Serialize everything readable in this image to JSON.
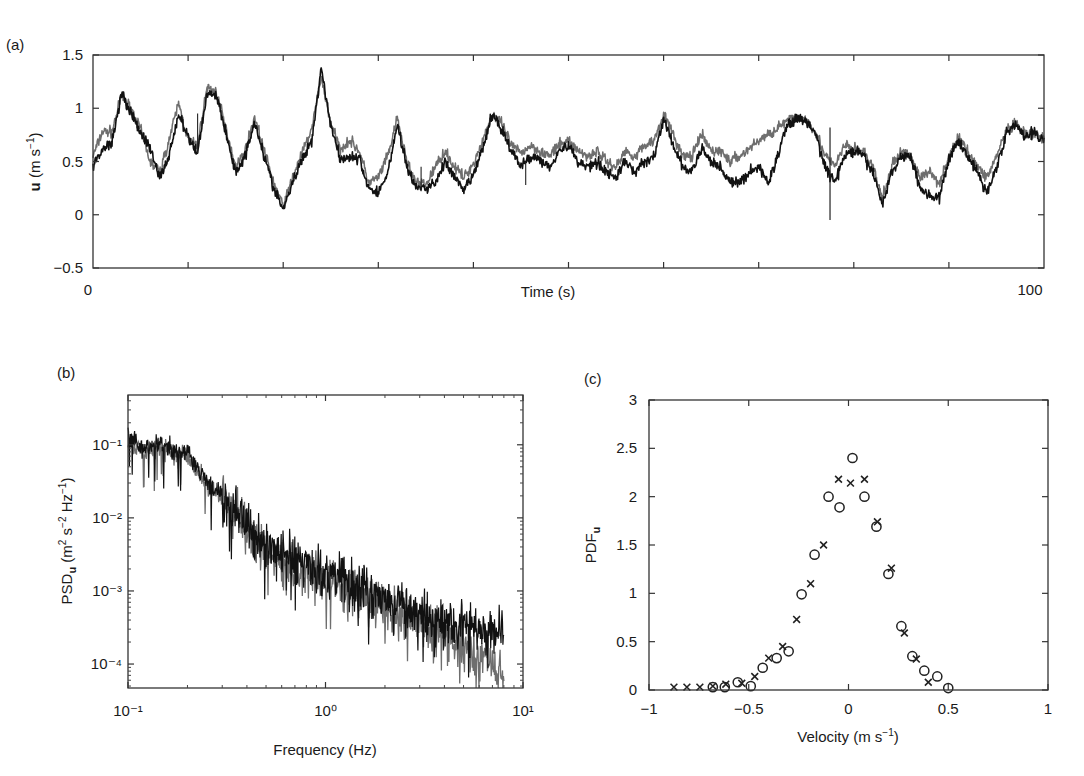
{
  "chart_data": [
    {
      "panel": "(a)",
      "type": "line",
      "title": "",
      "xlabel": "Time (s)",
      "ylabel": "u (m s⁻¹)",
      "xlim": [
        0,
        100
      ],
      "ylim": [
        -0.5,
        1.5
      ],
      "xtick_labels": [
        "0",
        "100"
      ],
      "ytick_labels": [
        "1.5",
        "1",
        "0.5",
        "0",
        "−0.5"
      ],
      "ytick_values": [
        1.5,
        1,
        0.5,
        0,
        -0.5
      ],
      "minor_xticks_every": 10,
      "grid": false,
      "legend": null,
      "series": [
        {
          "name": "measured (black)",
          "color": "#111111",
          "x": [
            0,
            1,
            2,
            3,
            4,
            5,
            6,
            7,
            8,
            9,
            10,
            11,
            12,
            13,
            14,
            15,
            16,
            17,
            18,
            19,
            20,
            21,
            22,
            23,
            24,
            25,
            26,
            27,
            28,
            29,
            30,
            31,
            32,
            33,
            34,
            35,
            36,
            37,
            38,
            39,
            40,
            41,
            42,
            43,
            44,
            45,
            46,
            47,
            48,
            49,
            50,
            51,
            52,
            53,
            54,
            55,
            56,
            57,
            58,
            59,
            60,
            61,
            62,
            63,
            64,
            65,
            66,
            67,
            68,
            69,
            70,
            71,
            72,
            73,
            74,
            75,
            76,
            77,
            78,
            79,
            80,
            81,
            82,
            83,
            84,
            85,
            86,
            87,
            88,
            89,
            90,
            91,
            92,
            93,
            94,
            95,
            96,
            97,
            98,
            99,
            100
          ],
          "values": [
            0.45,
            0.62,
            0.68,
            1.15,
            0.95,
            0.78,
            0.62,
            0.35,
            0.55,
            0.95,
            0.72,
            0.58,
            1.15,
            1.12,
            0.75,
            0.4,
            0.55,
            0.88,
            0.55,
            0.25,
            0.05,
            0.3,
            0.52,
            0.7,
            1.38,
            0.85,
            0.52,
            0.55,
            0.52,
            0.25,
            0.2,
            0.4,
            0.85,
            0.45,
            0.25,
            0.25,
            0.3,
            0.5,
            0.35,
            0.22,
            0.38,
            0.62,
            0.95,
            0.8,
            0.6,
            0.45,
            0.55,
            0.52,
            0.45,
            0.6,
            0.65,
            0.5,
            0.45,
            0.5,
            0.4,
            0.35,
            0.5,
            0.4,
            0.5,
            0.55,
            0.9,
            0.65,
            0.45,
            0.4,
            0.62,
            0.5,
            0.45,
            0.3,
            0.3,
            0.4,
            0.45,
            0.3,
            0.55,
            0.85,
            0.9,
            0.88,
            0.75,
            0.45,
            0.3,
            0.55,
            0.6,
            0.55,
            0.4,
            0.1,
            0.4,
            0.55,
            0.55,
            0.25,
            0.18,
            0.15,
            0.52,
            0.7,
            0.55,
            0.4,
            0.2,
            0.45,
            0.75,
            0.85,
            0.72,
            0.78,
            0.7
          ]
        },
        {
          "name": "simulated (grey)",
          "color": "#6e6e6e",
          "x": [
            0,
            1,
            2,
            3,
            4,
            5,
            6,
            7,
            8,
            9,
            10,
            11,
            12,
            13,
            14,
            15,
            16,
            17,
            18,
            19,
            20,
            21,
            22,
            23,
            24,
            25,
            26,
            27,
            28,
            29,
            30,
            31,
            32,
            33,
            34,
            35,
            36,
            37,
            38,
            39,
            40,
            41,
            42,
            43,
            44,
            45,
            46,
            47,
            48,
            49,
            50,
            51,
            52,
            53,
            54,
            55,
            56,
            57,
            58,
            59,
            60,
            61,
            62,
            63,
            64,
            65,
            66,
            67,
            68,
            69,
            70,
            71,
            72,
            73,
            74,
            75,
            76,
            77,
            78,
            79,
            80,
            81,
            82,
            83,
            84,
            85,
            86,
            87,
            88,
            89,
            90,
            91,
            92,
            93,
            94,
            95,
            96,
            97,
            98,
            99,
            100
          ],
          "values": [
            0.55,
            0.78,
            0.78,
            1.12,
            1.0,
            0.8,
            0.5,
            0.4,
            0.7,
            1.05,
            0.7,
            0.65,
            1.2,
            1.15,
            0.8,
            0.45,
            0.6,
            0.92,
            0.6,
            0.3,
            0.08,
            0.35,
            0.58,
            0.8,
            1.3,
            0.85,
            0.62,
            0.7,
            0.6,
            0.3,
            0.35,
            0.55,
            0.9,
            0.5,
            0.3,
            0.28,
            0.45,
            0.6,
            0.45,
            0.35,
            0.48,
            0.7,
            0.95,
            0.85,
            0.65,
            0.58,
            0.65,
            0.6,
            0.55,
            0.65,
            0.7,
            0.6,
            0.55,
            0.6,
            0.5,
            0.45,
            0.6,
            0.55,
            0.65,
            0.7,
            0.95,
            0.75,
            0.55,
            0.55,
            0.75,
            0.6,
            0.6,
            0.5,
            0.55,
            0.62,
            0.7,
            0.75,
            0.82,
            0.88,
            0.92,
            0.9,
            0.78,
            0.55,
            0.45,
            0.65,
            0.62,
            0.6,
            0.45,
            0.15,
            0.45,
            0.6,
            0.55,
            0.35,
            0.4,
            0.3,
            0.55,
            0.72,
            0.6,
            0.45,
            0.35,
            0.55,
            0.78,
            0.85,
            0.75,
            0.75,
            0.72
          ]
        }
      ],
      "annotations": [
        {
          "x": 77.5,
          "y_from": 0.82,
          "y_to": -0.05,
          "note": "single-sample spike"
        }
      ]
    },
    {
      "panel": "(b)",
      "type": "line",
      "xscale": "log",
      "yscale": "log",
      "title": "",
      "xlabel": "Frequency (Hz)",
      "ylabel": "PSD_u (m² s⁻² Hz⁻¹)",
      "xlim": [
        0.1,
        10
      ],
      "ylim": [
        4.7e-05,
        0.48
      ],
      "xtick_labels": [
        "10⁻¹",
        "10⁰",
        "10¹"
      ],
      "xtick_values": [
        0.1,
        1,
        10
      ],
      "ytick_labels": [
        "10⁻¹",
        "10⁻²",
        "10⁻³",
        "10⁻⁴"
      ],
      "ytick_values": [
        0.1,
        0.01,
        0.001,
        0.0001
      ],
      "grid": false,
      "legend": null,
      "series": [
        {
          "name": "measured (black)",
          "color": "#111111",
          "x": [
            0.1,
            0.12,
            0.15,
            0.18,
            0.2,
            0.25,
            0.3,
            0.4,
            0.5,
            0.7,
            1.0,
            1.5,
            2.0,
            3.0,
            4.0,
            5.0,
            6.0,
            7.0,
            8.0
          ],
          "values": [
            0.13,
            0.09,
            0.1,
            0.075,
            0.08,
            0.03,
            0.02,
            0.008,
            0.004,
            0.0025,
            0.0018,
            0.0011,
            0.0008,
            0.0005,
            0.0004,
            0.00035,
            0.0003,
            0.00028,
            0.00028
          ]
        },
        {
          "name": "simulated (grey)",
          "color": "#6e6e6e",
          "x": [
            0.1,
            0.12,
            0.15,
            0.18,
            0.2,
            0.25,
            0.3,
            0.4,
            0.5,
            0.7,
            1.0,
            1.5,
            2.0,
            3.0,
            4.0,
            5.0,
            6.0,
            7.0,
            8.0
          ],
          "values": [
            0.11,
            0.085,
            0.09,
            0.07,
            0.075,
            0.028,
            0.018,
            0.007,
            0.0035,
            0.002,
            0.0014,
            0.0009,
            0.0006,
            0.00035,
            0.00025,
            0.00018,
            0.00014,
            0.0001,
            6e-05
          ]
        }
      ]
    },
    {
      "panel": "(c)",
      "type": "scatter",
      "title": "",
      "xlabel": "Velocity (m s⁻¹)",
      "ylabel": "PDF_u",
      "xlim": [
        -1,
        1
      ],
      "ylim": [
        0,
        3
      ],
      "xtick_labels": [
        "−1",
        "−0.5",
        "0",
        "0.5",
        "1"
      ],
      "xtick_values": [
        -1,
        -0.5,
        0,
        0.5,
        1
      ],
      "ytick_labels": [
        "3",
        "2.5",
        "2",
        "1.5",
        "1",
        "0.5",
        "0"
      ],
      "ytick_values": [
        3,
        2.5,
        2,
        1.5,
        1,
        0.5,
        0
      ],
      "grid": false,
      "legend": null,
      "series": [
        {
          "name": "circles",
          "marker": "o",
          "x": [
            -0.68,
            -0.62,
            -0.555,
            -0.49,
            -0.43,
            -0.36,
            -0.3,
            -0.235,
            -0.17,
            -0.1,
            -0.045,
            0.02,
            0.08,
            0.14,
            0.2,
            0.265,
            0.32,
            0.38,
            0.445,
            0.5
          ],
          "y": [
            0.03,
            0.03,
            0.08,
            0.04,
            0.23,
            0.33,
            0.4,
            0.99,
            1.4,
            2.0,
            1.89,
            2.4,
            2.0,
            1.69,
            1.2,
            0.66,
            0.35,
            0.2,
            0.14,
            0.02
          ]
        },
        {
          "name": "crosses",
          "marker": "x",
          "x": [
            -0.875,
            -0.81,
            -0.745,
            -0.68,
            -0.615,
            -0.535,
            -0.47,
            -0.4,
            -0.33,
            -0.26,
            -0.19,
            -0.125,
            -0.05,
            0.01,
            0.08,
            0.145,
            0.215,
            0.28,
            0.34,
            0.4
          ],
          "y": [
            0.03,
            0.03,
            0.03,
            0.04,
            0.06,
            0.07,
            0.14,
            0.33,
            0.45,
            0.73,
            1.1,
            1.5,
            2.18,
            2.14,
            2.18,
            1.74,
            1.26,
            0.59,
            0.32,
            0.08
          ]
        }
      ]
    }
  ],
  "panels": {
    "a": {
      "label": "(a)",
      "xlabel": "Time (s)",
      "ylabel_bold": "u",
      "ylabel_units": " (m s",
      "ylabel_sup": "−1",
      "ylabel_close": ")",
      "x0": "0",
      "x1": "100"
    },
    "b": {
      "label": "(b)",
      "xlabel": "Frequency (Hz)",
      "ylabel_main": "PSD",
      "ylabel_sub": "u",
      "ylabel_units": " (m",
      "ylabel_sup1": "2",
      "ylabel_mid": " s",
      "ylabel_sup2": "−2",
      "ylabel_mid2": " Hz",
      "ylabel_sup3": "−1",
      "ylabel_close": ")"
    },
    "c": {
      "label": "(c)",
      "xlabel_main": "Velocity (m s",
      "xlabel_sup": "−1",
      "xlabel_close": ")",
      "ylabel_main": "PDF",
      "ylabel_sub": "u"
    }
  }
}
